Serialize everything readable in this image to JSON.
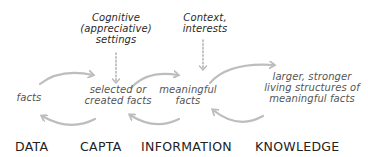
{
  "inputs": {
    "cognitive": [
      "Cognitive",
      "(appreciative)",
      "settings"
    ],
    "context": [
      "Context,",
      "interests"
    ]
  },
  "nodes": {
    "data": [
      "facts"
    ],
    "capta": [
      "selected or",
      "created facts"
    ],
    "information": [
      "meaningful",
      "facts"
    ],
    "knowledge": [
      "larger, stronger",
      "living structures of",
      "meaningful facts"
    ]
  },
  "stages": {
    "data": "DATA",
    "capta": "CAPTA",
    "information": "INFORMATION",
    "knowledge": "KNOWLEDGE"
  },
  "colors": {
    "arrow": "#bdbdbd",
    "dotted_arrow": "#b5b5b5",
    "text": "#3a3a3a"
  }
}
